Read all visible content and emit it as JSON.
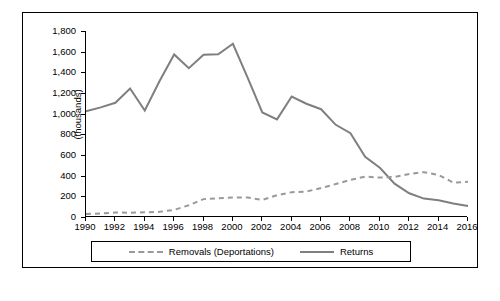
{
  "chart_data": {
    "type": "line",
    "title": "",
    "xlabel": "",
    "ylabel": "(thousands)",
    "ylim": [
      0,
      1800
    ],
    "xlim": [
      1990,
      2016
    ],
    "grid": false,
    "legend_position": "bottom",
    "y_ticks": [
      "0",
      "200",
      "400",
      "600",
      "800",
      "1,000",
      "1,200",
      "1,400",
      "1,600",
      "1,800"
    ],
    "y_tick_values": [
      0,
      200,
      400,
      600,
      800,
      1000,
      1200,
      1400,
      1600,
      1800
    ],
    "x_ticks": [
      "1990",
      "1992",
      "1994",
      "1996",
      "1998",
      "2000",
      "2002",
      "2004",
      "2006",
      "2008",
      "2010",
      "2012",
      "2014",
      "2016"
    ],
    "x": [
      1990,
      1991,
      1992,
      1993,
      1994,
      1995,
      1996,
      1997,
      1998,
      1999,
      2000,
      2001,
      2002,
      2003,
      2004,
      2005,
      2006,
      2007,
      2008,
      2009,
      2010,
      2011,
      2012,
      2013,
      2014,
      2015,
      2016
    ],
    "series": [
      {
        "name": "Removals (Deportations)",
        "style": "dashed",
        "color": "#999999",
        "values": [
          30,
          33,
          43,
          42,
          45,
          50,
          69,
          114,
          173,
          181,
          188,
          189,
          165,
          211,
          240,
          246,
          280,
          319,
          359,
          391,
          382,
          387,
          416,
          434,
          407,
          333,
          340
        ]
      },
      {
        "name": "Returns",
        "style": "solid",
        "color": "#7f7f7f",
        "values": [
          1023,
          1061,
          1105,
          1243,
          1030,
          1313,
          1573,
          1440,
          1570,
          1574,
          1676,
          1349,
          1012,
          945,
          1166,
          1096,
          1043,
          892,
          811,
          582,
          476,
          323,
          230,
          178,
          163,
          130,
          106
        ]
      }
    ],
    "legend": [
      "Removals (Deportations)",
      "Returns"
    ]
  }
}
